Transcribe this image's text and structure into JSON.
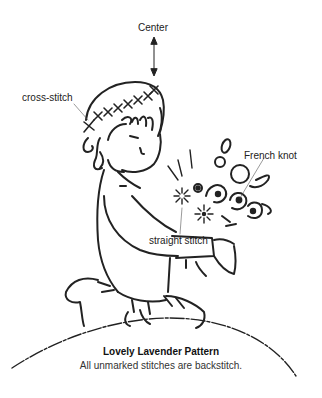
{
  "diagram": {
    "type": "embroidery-pattern",
    "line_color": "#222222",
    "background": "#ffffff"
  },
  "labels": {
    "center": "Center",
    "cross_stitch": "cross-stitch",
    "french_knot": "French knot",
    "straight_stitch": "straight stitch"
  },
  "caption": {
    "title": "Lovely Lavender Pattern",
    "subtitle": "All unmarked stitches are backstitch."
  }
}
